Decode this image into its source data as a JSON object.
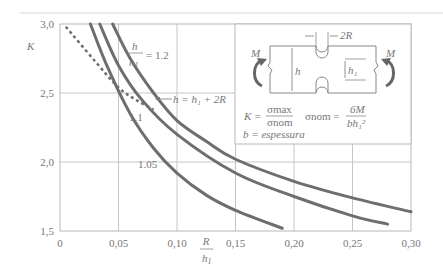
{
  "chart_data": {
    "type": "line",
    "title": "",
    "xlabel": "R / h1",
    "ylabel": "K",
    "xlim": [
      0,
      0.3
    ],
    "ylim": [
      1.5,
      3.0
    ],
    "grid": true,
    "x_ticks": [
      "0",
      "0,05",
      "0,10",
      "0,15",
      "0,20",
      "0,25",
      "0,30"
    ],
    "y_ticks": [
      "1.5",
      "2.0",
      "2.5",
      "3.0"
    ],
    "series": [
      {
        "name": "h/h1 = 1.2",
        "x": [
          0.045,
          0.06,
          0.08,
          0.1,
          0.125,
          0.15,
          0.2,
          0.25,
          0.3
        ],
        "y": [
          3.0,
          2.75,
          2.5,
          2.3,
          2.15,
          2.02,
          1.86,
          1.74,
          1.64
        ]
      },
      {
        "name": "h/h1 = 1.1",
        "x": [
          0.034,
          0.05,
          0.07,
          0.1,
          0.15,
          0.2,
          0.25,
          0.28
        ],
        "y": [
          3.0,
          2.7,
          2.45,
          2.2,
          1.92,
          1.75,
          1.61,
          1.55
        ]
      },
      {
        "name": "h/h1 = 1.05",
        "x": [
          0.026,
          0.04,
          0.06,
          0.08,
          0.1,
          0.125,
          0.15,
          0.19
        ],
        "y": [
          3.0,
          2.7,
          2.35,
          2.1,
          1.92,
          1.76,
          1.65,
          1.52
        ]
      },
      {
        "name": "h = h1 + 2R",
        "style": "dashed",
        "x": [
          0.005,
          0.03,
          0.05,
          0.065,
          0.08
        ],
        "y": [
          2.98,
          2.73,
          2.54,
          2.45,
          2.38
        ]
      }
    ],
    "annotations": [
      "h/h1 = 1.2",
      "1.1",
      "1.05",
      "h = h1 + 2R"
    ]
  },
  "labels": {
    "y_axis": "K",
    "x_axis_num": "R",
    "x_axis_den": "h",
    "x_axis_den_sub": "1",
    "ratio_num": "h",
    "ratio_den": "h",
    "ratio_den_sub": "1",
    "ratio_value": "= 1.2",
    "label_11": "1.1",
    "label_105": "1.05",
    "dashed_label": "h = h₁ + 2R"
  },
  "inset": {
    "moment_left": "M",
    "moment_right": "M",
    "dim_2R": "2R",
    "dim_h": "h",
    "dim_h1": "h₁",
    "formula_K": "K =",
    "sigma_max": "σmax",
    "sigma_nom": "σnom",
    "sigma_nom_def": "σnom =",
    "six_M": "6M",
    "b_h1_sq": "bh₁²",
    "thickness": "b = espessura"
  }
}
